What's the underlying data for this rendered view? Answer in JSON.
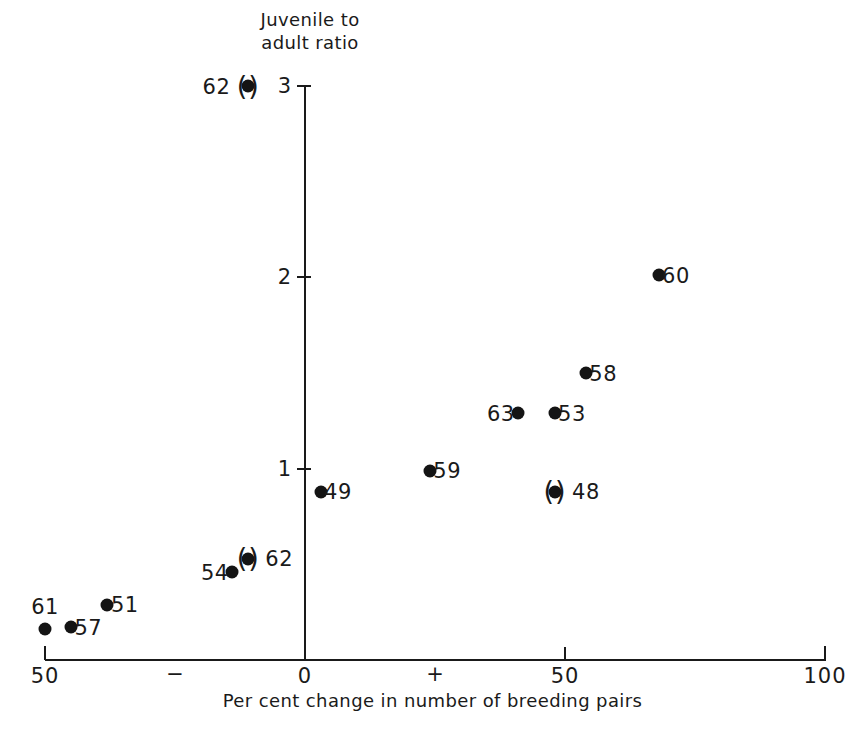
{
  "chart_data": {
    "type": "scatter",
    "title": "",
    "xlabel": "Per cent change in number of breeding pairs",
    "ylabel": "Juvenile to adult ratio",
    "xlim": [
      -50,
      100
    ],
    "ylim": [
      0,
      3
    ],
    "grid": false,
    "legend": null,
    "x_ticks": [
      {
        "value": -50,
        "label": "50"
      },
      {
        "value": 0,
        "label": "0"
      },
      {
        "value": 50,
        "label": "50"
      },
      {
        "value": 100,
        "label": "100"
      }
    ],
    "x_sign_marks": [
      {
        "value": -25,
        "label": "−"
      },
      {
        "value": 25,
        "label": "+"
      }
    ],
    "y_ticks": [
      {
        "value": 1,
        "label": "1"
      },
      {
        "value": 2,
        "label": "2"
      },
      {
        "value": 3,
        "label": "3"
      }
    ],
    "points": [
      {
        "label": "62",
        "x": -11,
        "y": 3.0,
        "label_side": "left",
        "parenthesised": true
      },
      {
        "label": "60",
        "x": 68,
        "y": 2.01,
        "label_side": "right",
        "parenthesised": false
      },
      {
        "label": "58",
        "x": 54,
        "y": 1.5,
        "label_side": "right",
        "parenthesised": false
      },
      {
        "label": "63",
        "x": 41,
        "y": 1.29,
        "label_side": "left",
        "parenthesised": false
      },
      {
        "label": "53",
        "x": 48,
        "y": 1.29,
        "label_side": "right",
        "parenthesised": false
      },
      {
        "label": "59",
        "x": 24,
        "y": 0.99,
        "label_side": "right",
        "parenthesised": false
      },
      {
        "label": "49",
        "x": 3,
        "y": 0.88,
        "label_side": "right",
        "parenthesised": false
      },
      {
        "label": "48",
        "x": 48,
        "y": 0.88,
        "label_side": "right",
        "parenthesised": true
      },
      {
        "label": "62",
        "x": -11,
        "y": 0.53,
        "label_side": "right",
        "parenthesised": true
      },
      {
        "label": "54",
        "x": -14,
        "y": 0.46,
        "label_side": "left",
        "parenthesised": false
      },
      {
        "label": "51",
        "x": -38,
        "y": 0.29,
        "label_side": "right",
        "parenthesised": false
      },
      {
        "label": "57",
        "x": -45,
        "y": 0.17,
        "label_side": "right",
        "parenthesised": false
      },
      {
        "label": "61",
        "x": -50,
        "y": 0.16,
        "label_side": "above",
        "parenthesised": false
      }
    ],
    "colors": {
      "marker": "#141414",
      "axis": "#1a1a1a",
      "background": "#ffffff"
    }
  }
}
